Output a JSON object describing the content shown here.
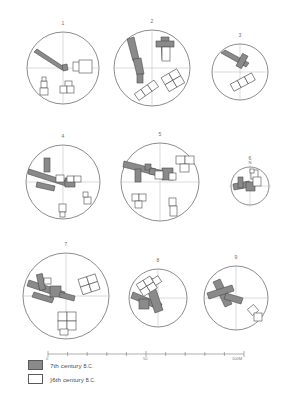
{
  "figure": {
    "background_color": "#ffffff",
    "line_color": "#5a5a5a",
    "fill_seventh": "#8a8a8a",
    "fill_sixth": "#ffffff"
  },
  "panels": [
    {
      "id": "panel-1",
      "label": "1",
      "cx": 63,
      "cy": 68,
      "r": 37,
      "north": ""
    },
    {
      "id": "panel-2",
      "label": "2",
      "cx": 152,
      "cy": 68,
      "r": 39,
      "north": ""
    },
    {
      "id": "panel-3",
      "label": "3",
      "cx": 240,
      "cy": 72,
      "r": 29,
      "north": ""
    },
    {
      "id": "panel-4",
      "label": "4",
      "cx": 63,
      "cy": 182,
      "r": 38,
      "north": ""
    },
    {
      "id": "panel-5",
      "label": "5",
      "cx": 160,
      "cy": 182,
      "r": 40,
      "north": ""
    },
    {
      "id": "panel-6",
      "label": "6",
      "cx": 250,
      "cy": 186,
      "r": 20,
      "north": "N"
    },
    {
      "id": "panel-7",
      "label": "7",
      "cx": 66,
      "cy": 296,
      "r": 44,
      "north": ""
    },
    {
      "id": "panel-8",
      "label": "8",
      "cx": 158,
      "cy": 298,
      "r": 30,
      "north": ""
    },
    {
      "id": "panel-9",
      "label": "9",
      "cx": 236,
      "cy": 298,
      "r": 33,
      "north": ""
    }
  ],
  "legend": {
    "title": "",
    "items": [
      {
        "key": "seventh",
        "swatch": "#8a8a8a",
        "label": "7th century ",
        "era": "B.C."
      },
      {
        "key": "sixth",
        "swatch": "#ffffff",
        "label": "}6th century ",
        "era": "B.C."
      }
    ]
  },
  "scale": {
    "ticks": [
      "0",
      "50",
      "100M"
    ],
    "tick_positions": [
      0,
      50,
      100
    ],
    "unit": "M",
    "min": 0,
    "max": 100,
    "minor_divisions": 10
  }
}
